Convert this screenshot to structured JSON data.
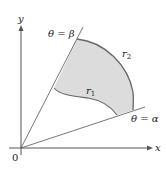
{
  "diagram": {
    "axes": {
      "x_label": "x",
      "y_label": "y",
      "origin_label": "0"
    },
    "rays": {
      "beta_label": "θ = β",
      "alpha_label": "θ = α"
    },
    "curves": {
      "inner_label": "r",
      "inner_sub": "1",
      "outer_label": "r",
      "outer_sub": "2"
    },
    "colors": {
      "region_fill": "#dcdcdc",
      "line": "#555555",
      "boundary": "#666666"
    }
  }
}
